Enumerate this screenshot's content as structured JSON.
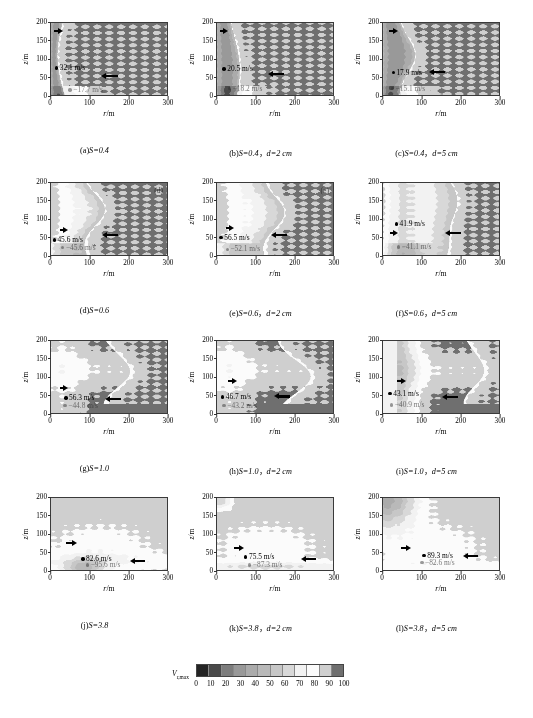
{
  "figure": {
    "axis": {
      "xlabel_sym": "r",
      "xlabel_unit": "/m",
      "ylabel_sym": "z",
      "ylabel_unit": "/m",
      "xticks": [
        "0",
        "100",
        "200",
        "300"
      ],
      "yticks": [
        "0",
        "50",
        "100",
        "150",
        "200"
      ],
      "xlim": [
        0,
        300
      ],
      "ylim": [
        0,
        200
      ]
    },
    "colorbar": {
      "label": "V",
      "label_sub": "r,max",
      "ticks": [
        "0",
        "10",
        "20",
        "30",
        "40",
        "50",
        "60",
        "70",
        "80",
        "90",
        "100"
      ],
      "range": [
        0,
        100
      ],
      "colors": [
        "#242424",
        "#4a4a4a",
        "#7d7d7d",
        "#999999",
        "#ababab",
        "#b9b9b9",
        "#c7c7c7",
        "#d8d8d8",
        "#f2f2f2",
        "#fbfbfb",
        "#cfcfcf",
        "#6f6f6f"
      ]
    },
    "bottom_caption": ""
  },
  "chart_data": {
    "type": "heatmap",
    "title": "",
    "xlabel": "r/m",
    "ylabel": "z/m",
    "xlim": [
      0,
      300
    ],
    "ylim": [
      0,
      200
    ],
    "colorbar_label": "V_r,max",
    "colorbar_range": [
      0,
      100
    ],
    "colorbar_ticks": [
      0,
      10,
      20,
      30,
      40,
      50,
      60,
      70,
      80,
      90,
      100
    ],
    "grid": false,
    "legend": "none",
    "panels": [
      {
        "id": "a",
        "caption_prefix": "(a)",
        "caption_s": "S=0.4",
        "caption_d": "",
        "S": 0.4,
        "d_cm": null,
        "corner_tag": "",
        "inflow_max": "32.1 m/s",
        "outflow_max": "−17.7 m/s",
        "inflow_value": 32.1,
        "outflow_value": -17.7,
        "outflow_faded": true,
        "markers": [
          {
            "label": "32.1 m/s",
            "x": 10,
            "y": 75,
            "faded": false
          },
          {
            "label": "−17.7 m/s",
            "x": 45,
            "y": 14,
            "faded": true
          }
        ],
        "arrows": [
          {
            "dir": "right",
            "x": 8,
            "y": 178,
            "len": 22
          },
          {
            "dir": "left",
            "x": 130,
            "y": 52,
            "len": 42
          }
        ]
      },
      {
        "id": "b",
        "caption_prefix": "(b)",
        "caption_s": "S=0.4",
        "caption_d": "d=2 cm",
        "S": 0.4,
        "d_cm": 2,
        "corner_tag": "",
        "inflow_max": "20.5 m/s",
        "outflow_max": "−18.2 m/s",
        "inflow_value": 20.5,
        "outflow_value": -18.2,
        "outflow_faded": false,
        "markers": [
          {
            "label": "20.5 m/s",
            "x": 14,
            "y": 72,
            "faded": false
          },
          {
            "label": "−18.2 m/s",
            "x": 28,
            "y": 18,
            "faded": true
          }
        ],
        "arrows": [
          {
            "dir": "right",
            "x": 8,
            "y": 177,
            "len": 20
          },
          {
            "dir": "left",
            "x": 132,
            "y": 58,
            "len": 42
          }
        ]
      },
      {
        "id": "c",
        "caption_prefix": "(c)",
        "caption_s": "S=0.4",
        "caption_d": "d=5 cm",
        "S": 0.4,
        "d_cm": 5,
        "corner_tag": "",
        "inflow_max": "17.9 m/s",
        "outflow_max": "−15.1 m/s",
        "inflow_value": 17.9,
        "outflow_value": -15.1,
        "outflow_faded": true,
        "markers": [
          {
            "label": "17.9 m/s",
            "x": 22,
            "y": 62,
            "faded": false
          },
          {
            "label": "−15.1 m/s",
            "x": 20,
            "y": 18,
            "faded": true
          }
        ],
        "arrows": [
          {
            "dir": "right",
            "x": 16,
            "y": 178,
            "len": 22
          },
          {
            "dir": "left",
            "x": 118,
            "y": 64,
            "len": 42
          }
        ]
      },
      {
        "id": "d",
        "caption_prefix": "(d)",
        "caption_s": "S=0.6",
        "caption_d": "",
        "S": 0.6,
        "d_cm": null,
        "corner_tag": "(d)",
        "inflow_max": "45.6 m/s",
        "outflow_max": "−45.6 m/s",
        "inflow_value": 45.6,
        "outflow_value": -45.6,
        "outflow_faded": true,
        "markers": [
          {
            "label": "45.6 m/s",
            "x": 4,
            "y": 42,
            "faded": false
          },
          {
            "label": "−45.6 m/s",
            "x": 26,
            "y": 20,
            "faded": true
          }
        ],
        "arrows": [
          {
            "dir": "right",
            "x": 22,
            "y": 70,
            "len": 22
          },
          {
            "dir": "left",
            "x": 132,
            "y": 56,
            "len": 42
          }
        ]
      },
      {
        "id": "e",
        "caption_prefix": "(e)",
        "caption_s": "S=0.6",
        "caption_d": "d=2 cm",
        "S": 0.6,
        "d_cm": 2,
        "corner_tag": "(e)",
        "inflow_max": "56.5 m/s",
        "outflow_max": "−52.1 m/s",
        "inflow_value": 56.5,
        "outflow_value": -52.1,
        "outflow_faded": true,
        "markers": [
          {
            "label": "56.5 m/s",
            "x": 6,
            "y": 48,
            "faded": false
          },
          {
            "label": "−52.1 m/s",
            "x": 22,
            "y": 16,
            "faded": true
          }
        ],
        "arrows": [
          {
            "dir": "right",
            "x": 22,
            "y": 74,
            "len": 22
          },
          {
            "dir": "left",
            "x": 140,
            "y": 56,
            "len": 42
          }
        ]
      },
      {
        "id": "f",
        "caption_prefix": "(f)",
        "caption_s": "S=0.6",
        "caption_d": "d=5 cm",
        "S": 0.6,
        "d_cm": 5,
        "corner_tag": "",
        "inflow_max": "41.9 m/s",
        "outflow_max": "−41.1 m/s",
        "inflow_value": 41.9,
        "outflow_value": -41.1,
        "outflow_faded": true,
        "markers": [
          {
            "label": "41.9 m/s",
            "x": 30,
            "y": 86,
            "faded": false
          },
          {
            "label": "−41.1 m/s",
            "x": 36,
            "y": 22,
            "faded": true
          }
        ],
        "arrows": [
          {
            "dir": "right",
            "x": 18,
            "y": 62,
            "len": 22
          },
          {
            "dir": "left",
            "x": 160,
            "y": 60,
            "len": 42
          }
        ]
      },
      {
        "id": "g",
        "caption_prefix": "(g)",
        "caption_s": "S=1.0",
        "caption_d": "",
        "S": 1.0,
        "d_cm": null,
        "corner_tag": "",
        "inflow_max": "56.3 m/s",
        "outflow_max": "−44.8 m/s",
        "inflow_value": 56.3,
        "outflow_value": -44.8,
        "outflow_faded": false,
        "markers": [
          {
            "label": "56.3 m/s",
            "x": 34,
            "y": 42,
            "faded": false
          },
          {
            "label": "−44.8 m/s",
            "x": 32,
            "y": 20,
            "faded": true
          }
        ],
        "arrows": [
          {
            "dir": "right",
            "x": 22,
            "y": 70,
            "len": 22
          },
          {
            "dir": "left",
            "x": 140,
            "y": 38,
            "len": 42
          }
        ]
      },
      {
        "id": "h",
        "caption_prefix": "(h)",
        "caption_s": "S=1.0",
        "caption_d": "d=2 cm",
        "S": 1.0,
        "d_cm": 2,
        "corner_tag": "",
        "inflow_max": "46.7 m/s",
        "outflow_max": "−43.2 m/s",
        "inflow_value": 46.7,
        "outflow_value": -43.2,
        "outflow_faded": false,
        "markers": [
          {
            "label": "46.7 m/s",
            "x": 10,
            "y": 44,
            "faded": false
          },
          {
            "label": "−43.2 m/s",
            "x": 14,
            "y": 20,
            "faded": true
          }
        ],
        "arrows": [
          {
            "dir": "right",
            "x": 28,
            "y": 88,
            "len": 24
          },
          {
            "dir": "left",
            "x": 148,
            "y": 46,
            "len": 42
          }
        ]
      },
      {
        "id": "i",
        "caption_prefix": "(i)",
        "caption_s": "S=1.0",
        "caption_d": "d=5 cm",
        "S": 1.0,
        "d_cm": 5,
        "corner_tag": "",
        "inflow_max": "43.1 m/s",
        "outflow_max": "−40.9 m/s",
        "inflow_value": 43.1,
        "outflow_value": -40.9,
        "outflow_faded": false,
        "markers": [
          {
            "label": "43.1 m/s",
            "x": 14,
            "y": 54,
            "faded": false
          },
          {
            "label": "−40.9 m/s",
            "x": 18,
            "y": 22,
            "faded": true
          }
        ],
        "arrows": [
          {
            "dir": "right",
            "x": 36,
            "y": 88,
            "len": 24
          },
          {
            "dir": "left",
            "x": 152,
            "y": 44,
            "len": 42
          }
        ]
      },
      {
        "id": "j",
        "caption_prefix": "(j)",
        "caption_s": "S=3.8",
        "caption_d": "",
        "S": 3.8,
        "d_cm": null,
        "corner_tag": "",
        "inflow_max": "82.6 m/s",
        "outflow_max": "−95.6 m/s",
        "inflow_value": 82.6,
        "outflow_value": -95.6,
        "outflow_faded": true,
        "markers": [
          {
            "label": "82.6 m/s",
            "x": 78,
            "y": 30,
            "faded": false
          },
          {
            "label": "−95.6 m/s",
            "x": 90,
            "y": 14,
            "faded": true
          }
        ],
        "arrows": [
          {
            "dir": "right",
            "x": 40,
            "y": 74,
            "len": 26
          },
          {
            "dir": "left",
            "x": 204,
            "y": 26,
            "len": 40
          }
        ]
      },
      {
        "id": "k",
        "caption_prefix": "(k)",
        "caption_s": "S=3.8",
        "caption_d": "d=2 cm",
        "S": 3.8,
        "d_cm": 2,
        "corner_tag": "",
        "inflow_max": "75.5 m/s",
        "outflow_max": "−87.3 m/s",
        "inflow_value": 75.5,
        "outflow_value": -87.3,
        "outflow_faded": true,
        "markers": [
          {
            "label": "75.5 m/s",
            "x": 70,
            "y": 36,
            "faded": false
          },
          {
            "label": "−87.3 m/s",
            "x": 80,
            "y": 14,
            "faded": true
          }
        ],
        "arrows": [
          {
            "dir": "right",
            "x": 44,
            "y": 62,
            "len": 26
          },
          {
            "dir": "left",
            "x": 218,
            "y": 30,
            "len": 38
          }
        ]
      },
      {
        "id": "l",
        "caption_prefix": "(l)",
        "caption_s": "S=3.8",
        "caption_d": "d=5 cm",
        "S": 3.8,
        "d_cm": 5,
        "corner_tag": "",
        "inflow_max": "89.3 m/s",
        "outflow_max": "−82.6 m/s",
        "inflow_value": 89.3,
        "outflow_value": -82.6,
        "outflow_faded": true,
        "markers": [
          {
            "label": "89.3 m/s",
            "x": 102,
            "y": 40,
            "faded": false
          },
          {
            "label": "−82.6 m/s",
            "x": 96,
            "y": 20,
            "faded": true
          }
        ],
        "arrows": [
          {
            "dir": "right",
            "x": 46,
            "y": 62,
            "len": 26
          },
          {
            "dir": "left",
            "x": 208,
            "y": 38,
            "len": 38
          }
        ]
      }
    ]
  }
}
